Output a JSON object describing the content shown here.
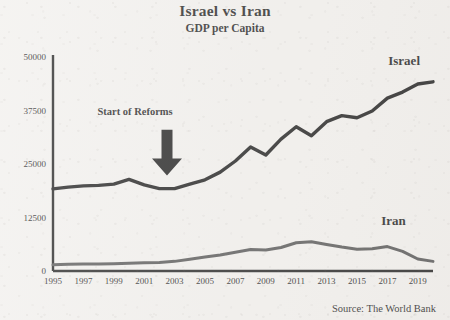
{
  "chart_data": {
    "type": "line",
    "title": "Israel vs Iran",
    "subtitle": "GDP per Capita",
    "xlabel": "",
    "ylabel": "",
    "grid": false,
    "legend_position": "inline-right",
    "source": "Source: The World Bank",
    "xlim": [
      1995,
      2020
    ],
    "ylim": [
      0,
      50000
    ],
    "ytick_labels": [
      "0",
      "12500",
      "25000",
      "37500",
      "50000"
    ],
    "ytick_values": [
      0,
      12500,
      25000,
      37500,
      50000
    ],
    "xtick_labels": [
      "1995",
      "1997",
      "1999",
      "2001",
      "2003",
      "2005",
      "2007",
      "2009",
      "2011",
      "2013",
      "2015",
      "2017",
      "2019"
    ],
    "xtick_values": [
      1995,
      1997,
      1999,
      2001,
      2003,
      2005,
      2007,
      2009,
      2011,
      2013,
      2015,
      2017,
      2019
    ],
    "x": [
      1995,
      1996,
      1997,
      1998,
      1999,
      2000,
      2001,
      2002,
      2003,
      2004,
      2005,
      2006,
      2007,
      2008,
      2009,
      2010,
      2011,
      2012,
      2013,
      2014,
      2015,
      2016,
      2017,
      2018,
      2019,
      2020
    ],
    "series": [
      {
        "name": "Israel",
        "color": "#0d0d0d",
        "width": 3.4,
        "label_x": 2018.1,
        "label_y": 48200,
        "values": [
          19200,
          19600,
          19900,
          20000,
          20300,
          21400,
          20100,
          19250,
          19250,
          20300,
          21300,
          23100,
          25700,
          29000,
          27100,
          30800,
          33700,
          31600,
          34900,
          36300,
          35800,
          37400,
          40400,
          41800,
          43700,
          44200
        ]
      },
      {
        "name": "Iran",
        "color": "#4a4a4a",
        "width": 3.0,
        "label_x": 2017.4,
        "label_y": 10800,
        "values": [
          1440,
          1560,
          1620,
          1650,
          1700,
          1800,
          1900,
          2000,
          2250,
          2750,
          3250,
          3750,
          4400,
          5000,
          4900,
          5500,
          6600,
          6850,
          6200,
          5600,
          5100,
          5200,
          5700,
          4600,
          2800,
          2250
        ]
      }
    ],
    "annotations": [
      {
        "text": "Start of Reforms",
        "arrow": "down-arrow",
        "text_x": 2000.4,
        "text_y": 36500,
        "arrow_x": 2002.5,
        "arrow_top_y": 33000,
        "arrow_tip_y": 22300
      }
    ]
  }
}
